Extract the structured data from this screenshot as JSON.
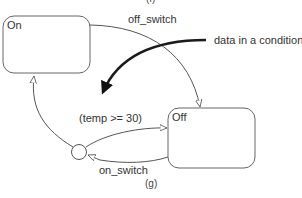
{
  "diagram": {
    "top_caption_fragment": "(f)",
    "caption": "(g)",
    "states": [
      {
        "id": "on",
        "label": "On"
      },
      {
        "id": "off",
        "label": "Off"
      }
    ],
    "pseudostates": [
      {
        "id": "junction",
        "type": "condition-junction"
      }
    ],
    "transitions": [
      {
        "from": "on",
        "to": "off",
        "label": "off_switch"
      },
      {
        "from": "off",
        "to": "junction",
        "label": "on_switch"
      },
      {
        "from": "junction",
        "to": "off",
        "label": "(temp >= 30)"
      },
      {
        "from": "junction",
        "to": "on",
        "label": ""
      }
    ],
    "annotation": {
      "text": "data in a condition",
      "points_to": "(temp >= 30)"
    }
  }
}
